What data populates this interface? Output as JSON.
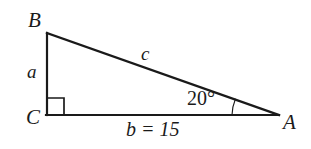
{
  "figure": {
    "type": "right-triangle-diagram",
    "background_color": "#ffffff",
    "stroke_color": "#1a1a1a"
  },
  "vertices": [
    {
      "name": "B",
      "label": "B",
      "x": 47,
      "y": 33
    },
    {
      "name": "C",
      "label": "C",
      "x": 47,
      "y": 115
    },
    {
      "name": "A",
      "label": "A",
      "x": 278,
      "y": 115
    }
  ],
  "sides": [
    {
      "name": "a",
      "label": "a",
      "from": "B",
      "to": "C",
      "role": "opposite-leg"
    },
    {
      "name": "b",
      "label": "b = 15",
      "value": 15,
      "from": "C",
      "to": "A",
      "role": "adjacent-leg"
    },
    {
      "name": "c",
      "label": "c",
      "from": "B",
      "to": "A",
      "role": "hypotenuse"
    }
  ],
  "angles": [
    {
      "at": "A",
      "label": "20°",
      "value": 20,
      "unit": "degrees",
      "marker": "arc"
    },
    {
      "at": "C",
      "label": "",
      "value": 90,
      "unit": "degrees",
      "marker": "square"
    }
  ],
  "markers": {
    "right_angle_square": {
      "x": 47,
      "y": 98,
      "size": 17
    },
    "angle_arc": {
      "center_x": 278,
      "center_y": 115,
      "radius": 46
    }
  }
}
